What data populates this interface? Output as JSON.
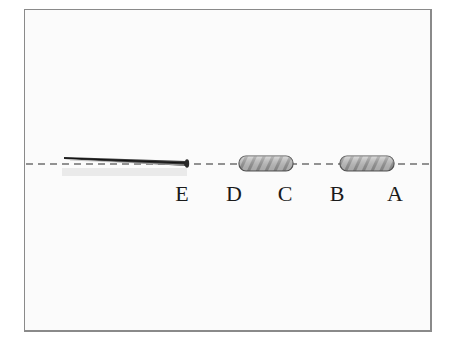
{
  "figure": {
    "labels": [
      {
        "id": "E",
        "text": "E",
        "x": 182
      },
      {
        "id": "D",
        "text": "D",
        "x": 234
      },
      {
        "id": "C",
        "text": "C",
        "x": 285
      },
      {
        "id": "B",
        "text": "B",
        "x": 337
      },
      {
        "id": "A",
        "text": "A",
        "x": 395
      }
    ],
    "objects": [
      {
        "name": "nail",
        "description": "long thin nail/pin lying along the axis, head at right near E"
      },
      {
        "name": "magnet-DC",
        "description": "rounded cylinder spanning D to C"
      },
      {
        "name": "magnet-BA",
        "description": "rounded cylinder spanning B to A"
      }
    ],
    "axis": {
      "style": "dashed",
      "color": "#707070"
    }
  }
}
